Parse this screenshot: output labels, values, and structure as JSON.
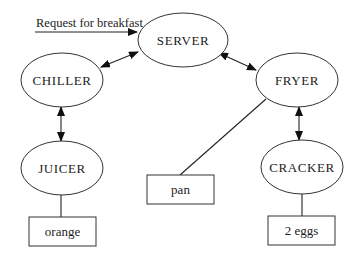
{
  "diagram": {
    "request": {
      "label": "Request for breakfast"
    },
    "nodes": [
      {
        "id": "server",
        "label": "SERVER",
        "shape": "ellipse"
      },
      {
        "id": "chiller",
        "label": "CHILLER",
        "shape": "ellipse"
      },
      {
        "id": "fryer",
        "label": "FRYER",
        "shape": "ellipse"
      },
      {
        "id": "juicer",
        "label": "JUICER",
        "shape": "ellipse"
      },
      {
        "id": "cracker",
        "label": "CRACKER",
        "shape": "ellipse"
      }
    ],
    "resources": [
      {
        "id": "orange",
        "label": "orange",
        "shape": "box",
        "attached_to": "juicer"
      },
      {
        "id": "pan",
        "label": "pan",
        "shape": "box",
        "attached_to": "fryer"
      },
      {
        "id": "eggs",
        "label": "2 eggs",
        "shape": "box",
        "attached_to": "cracker"
      }
    ],
    "edges": [
      {
        "from": "external",
        "to": "server",
        "type": "arrow",
        "label": "Request for breakfast"
      },
      {
        "from": "server",
        "to": "chiller",
        "type": "bidirectional-arrow"
      },
      {
        "from": "server",
        "to": "fryer",
        "type": "bidirectional-arrow"
      },
      {
        "from": "chiller",
        "to": "juicer",
        "type": "bidirectional-arrow"
      },
      {
        "from": "fryer",
        "to": "cracker",
        "type": "bidirectional-arrow"
      },
      {
        "from": "juicer",
        "to": "orange",
        "type": "line"
      },
      {
        "from": "fryer",
        "to": "pan",
        "type": "line"
      },
      {
        "from": "cracker",
        "to": "eggs",
        "type": "line"
      }
    ]
  }
}
